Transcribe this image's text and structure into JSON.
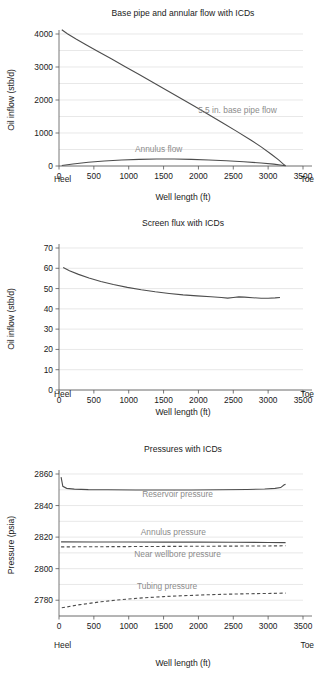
{
  "figure": {
    "panel_count": 3
  },
  "chart_data": [
    {
      "type": "line",
      "title": "Base pipe and annular flow with ICDs",
      "xlabel": "Well length (ft)",
      "ylabel": "Oil inflow (stb/d)",
      "xlim": [
        0,
        3500
      ],
      "ylim": [
        0,
        4000
      ],
      "xticks": [
        0,
        500,
        1000,
        1500,
        2000,
        2500,
        3000,
        3500
      ],
      "yticks": [
        0,
        1000,
        2000,
        3000,
        4000
      ],
      "yminor_step": 500,
      "grid": true,
      "x_end_labels": {
        "left": "Heel",
        "right": "Toe"
      },
      "annotations": [
        {
          "text": "5.5 in. base pipe flow",
          "x": 2560,
          "y": 1620,
          "color": "#8c8c8c"
        },
        {
          "text": "Annulus flow",
          "x": 1430,
          "y": 430,
          "color": "#8c8c8c"
        }
      ],
      "series": [
        {
          "name": "5.5 in. base pipe flow",
          "style": "solid",
          "color": "#4d4d4d",
          "points": [
            [
              40,
              4130
            ],
            [
              120,
              4010
            ],
            [
              250,
              3840
            ],
            [
              400,
              3660
            ],
            [
              560,
              3470
            ],
            [
              750,
              3250
            ],
            [
              950,
              3010
            ],
            [
              1150,
              2770
            ],
            [
              1350,
              2530
            ],
            [
              1550,
              2290
            ],
            [
              1750,
              2045
            ],
            [
              1950,
              1800
            ],
            [
              2150,
              1555
            ],
            [
              2350,
              1305
            ],
            [
              2550,
              1050
            ],
            [
              2750,
              790
            ],
            [
              2900,
              580
            ],
            [
              3050,
              350
            ],
            [
              3150,
              185
            ],
            [
              3230,
              35
            ],
            [
              3250,
              10
            ]
          ]
        },
        {
          "name": "Annulus flow",
          "style": "solid",
          "color": "#4d4d4d",
          "points": [
            [
              40,
              15
            ],
            [
              200,
              62
            ],
            [
              420,
              112
            ],
            [
              650,
              152
            ],
            [
              900,
              182
            ],
            [
              1150,
              200
            ],
            [
              1400,
              210
            ],
            [
              1650,
              210
            ],
            [
              1900,
              200
            ],
            [
              2150,
              183
            ],
            [
              2400,
              158
            ],
            [
              2650,
              128
            ],
            [
              2900,
              92
            ],
            [
              3080,
              58
            ],
            [
              3200,
              25
            ],
            [
              3250,
              8
            ]
          ]
        }
      ]
    },
    {
      "type": "line",
      "title": "Screen flux with ICDs",
      "xlabel": "Well length (ft)",
      "ylabel": "Oil inflow (stb/d)",
      "xlim": [
        0,
        3500
      ],
      "ylim": [
        0,
        70
      ],
      "xticks": [
        0,
        500,
        1000,
        1500,
        2000,
        2500,
        3000,
        3500
      ],
      "yticks": [
        0,
        10,
        20,
        30,
        40,
        50,
        60,
        70
      ],
      "yminor_step": 10,
      "grid": true,
      "x_end_labels": {
        "left": "Heel",
        "right": "Toe"
      },
      "annotations": [],
      "series": [
        {
          "name": "Screen flux",
          "style": "solid",
          "color": "#4d4d4d",
          "points": [
            [
              60,
              60.4
            ],
            [
              150,
              58.8
            ],
            [
              280,
              57.0
            ],
            [
              430,
              55.2
            ],
            [
              600,
              53.5
            ],
            [
              780,
              52.0
            ],
            [
              980,
              50.6
            ],
            [
              1180,
              49.4
            ],
            [
              1380,
              48.4
            ],
            [
              1580,
              47.6
            ],
            [
              1780,
              46.9
            ],
            [
              1980,
              46.4
            ],
            [
              2180,
              46.0
            ],
            [
              2330,
              45.6
            ],
            [
              2420,
              45.3
            ],
            [
              2500,
              45.6
            ],
            [
              2580,
              45.9
            ],
            [
              2660,
              45.8
            ],
            [
              2780,
              45.5
            ],
            [
              2900,
              45.2
            ],
            [
              3000,
              45.2
            ],
            [
              3100,
              45.4
            ],
            [
              3170,
              45.6
            ]
          ]
        }
      ]
    },
    {
      "type": "line",
      "title": "Pressures with ICDs",
      "xlabel": "Well length (ft)",
      "ylabel": "Pressure (psia)",
      "xlim": [
        0,
        3500
      ],
      "ylim": [
        2770,
        2860
      ],
      "xticks": [
        0,
        500,
        1000,
        1500,
        2000,
        2500,
        3000,
        3500
      ],
      "yticks": [
        2780,
        2800,
        2820,
        2840,
        2860
      ],
      "yminor_step": 10,
      "grid": true,
      "x_end_labels": {
        "left": "Heel",
        "right": "Toe"
      },
      "annotations": [
        {
          "text": "Reservoir pressure",
          "x": 1700,
          "y": 2845.5,
          "color": "#8c8c8c"
        },
        {
          "text": "Annulus pressure",
          "x": 1640,
          "y": 2821.5,
          "color": "#8c8c8c"
        },
        {
          "text": "Near wellbore pressure",
          "x": 1700,
          "y": 2807.5,
          "color": "#8c8c8c"
        },
        {
          "text": "Tubing pressure",
          "x": 1550,
          "y": 2787.0,
          "color": "#8c8c8c"
        }
      ],
      "series": [
        {
          "name": "Reservoir pressure",
          "style": "solid",
          "color": "#8c8c8c",
          "points": [
            [
              30,
              2858
            ],
            [
              55,
              2852.2
            ],
            [
              110,
              2850.9
            ],
            [
              220,
              2850.4
            ],
            [
              420,
              2850.1
            ],
            [
              700,
              2850.0
            ],
            [
              1100,
              2849.9
            ],
            [
              1500,
              2849.9
            ],
            [
              1900,
              2849.9
            ],
            [
              2300,
              2850.0
            ],
            [
              2700,
              2850.2
            ],
            [
              2950,
              2850.5
            ],
            [
              3100,
              2850.9
            ],
            [
              3180,
              2851.4
            ],
            [
              3230,
              2853.2
            ],
            [
              3250,
              2853.4
            ]
          ]
        },
        {
          "name": "Annulus pressure",
          "style": "solid",
          "color": "#333333",
          "points": [
            [
              30,
              2817.0
            ],
            [
              500,
              2816.9
            ],
            [
              1000,
              2816.9
            ],
            [
              1500,
              2816.8
            ],
            [
              2000,
              2816.8
            ],
            [
              2500,
              2816.7
            ],
            [
              3000,
              2816.6
            ],
            [
              3250,
              2816.5
            ]
          ]
        },
        {
          "name": "Near wellbore pressure",
          "style": "dashed",
          "color": "#4d4d4d",
          "points": [
            [
              30,
              2813.8
            ],
            [
              500,
              2813.9
            ],
            [
              1000,
              2814.0
            ],
            [
              1500,
              2814.1
            ],
            [
              2000,
              2814.2
            ],
            [
              2500,
              2814.3
            ],
            [
              3000,
              2814.4
            ],
            [
              3250,
              2814.5
            ]
          ]
        },
        {
          "name": "Tubing pressure",
          "style": "dashed",
          "color": "#4d4d4d",
          "points": [
            [
              40,
              2775.2
            ],
            [
              300,
              2777.2
            ],
            [
              600,
              2779.0
            ],
            [
              900,
              2780.4
            ],
            [
              1200,
              2781.5
            ],
            [
              1500,
              2782.3
            ],
            [
              1800,
              2782.9
            ],
            [
              2100,
              2783.4
            ],
            [
              2400,
              2783.8
            ],
            [
              2700,
              2784.1
            ],
            [
              3000,
              2784.3
            ],
            [
              3250,
              2784.5
            ]
          ]
        }
      ]
    }
  ]
}
